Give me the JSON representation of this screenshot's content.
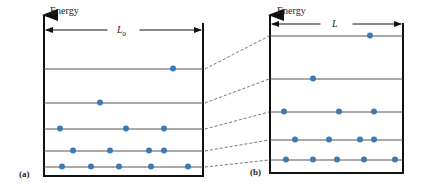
{
  "panels": [
    {
      "id": "a",
      "label": "(a)",
      "axis_label": "Energy",
      "width_symbol": "L",
      "width_subscript": "0",
      "box": {
        "left": 44,
        "right": 203,
        "top": 15,
        "bottom": 176
      },
      "levels": [
        {
          "y": 69,
          "particles_x": [
            173
          ]
        },
        {
          "y": 103,
          "particles_x": [
            100
          ]
        },
        {
          "y": 129,
          "particles_x": [
            60,
            126,
            164
          ]
        },
        {
          "y": 151,
          "particles_x": [
            73,
            110,
            149,
            164
          ]
        },
        {
          "y": 167,
          "particles_x": [
            62,
            91,
            119,
            151,
            188
          ]
        }
      ]
    },
    {
      "id": "b",
      "label": "(b)",
      "axis_label": "Energy",
      "width_symbol": "L",
      "width_subscript": "",
      "box": {
        "left": 270,
        "right": 403,
        "top": 15,
        "bottom": 173
      },
      "levels": [
        {
          "y": 36,
          "particles_x": [
            370
          ]
        },
        {
          "y": 79,
          "particles_x": [
            313
          ]
        },
        {
          "y": 112,
          "particles_x": [
            284,
            339,
            374
          ]
        },
        {
          "y": 140,
          "particles_x": [
            295,
            329,
            360,
            374
          ]
        },
        {
          "y": 160,
          "particles_x": [
            286,
            313,
            337,
            364,
            395
          ]
        }
      ]
    }
  ],
  "colors": {
    "particle": "#3a7bb5",
    "level_line": "#555555",
    "wall": "#111111",
    "connector": "#555555"
  }
}
